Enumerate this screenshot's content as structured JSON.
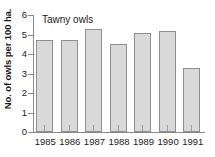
{
  "chart_data": {
    "type": "bar",
    "title": "Tawny owls",
    "xlabel": "",
    "ylabel": "No. of owls per 100 ha.",
    "categories": [
      "1985",
      "1986",
      "1987",
      "1988",
      "1989",
      "1990",
      "1991"
    ],
    "values": [
      4.7,
      4.7,
      5.3,
      4.5,
      5.1,
      5.2,
      3.3
    ],
    "ylim": [
      0,
      6
    ],
    "ytick_labels": [
      "0",
      "1",
      "2",
      "3",
      "4",
      "5",
      "6"
    ],
    "ytick_values": [
      0,
      1,
      2,
      3,
      4,
      5,
      6
    ],
    "grid": false,
    "legend": false,
    "bar_fill_color": "#d9d9d9",
    "bar_border_color": "#8f8f8f",
    "axis_color": "#8a8a8a",
    "text_color": "#1a1a1a"
  }
}
